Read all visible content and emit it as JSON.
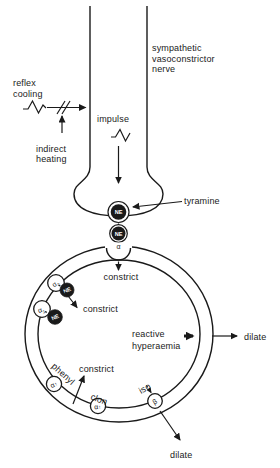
{
  "palette": {
    "ink": "#1a1a1a",
    "paper": "#ffffff",
    "vesicle_fill": "#1a1a1a",
    "vesicle_text": "#ffffff"
  },
  "nerve": {
    "label_line1": "sympathetic",
    "label_line2": "vasoconstrictor",
    "label_line3": "nerve"
  },
  "stimuli": {
    "reflex_line1": "reflex",
    "reflex_line2": "cooling",
    "indirect_line1": "indirect",
    "indirect_line2": "heating",
    "impulse": "impulse",
    "waveform_icon": "action-potential-wave",
    "block_icon": "double-slash-block"
  },
  "junction": {
    "vesicle1": "NE",
    "vesicle2": "NE",
    "tyramine": "tyramine"
  },
  "vessel": {
    "receptor_top": "α",
    "constrict_top": "constrict",
    "constrict_upper_left": "constrict",
    "constrict_lower": "constrict",
    "reactive_line1": "reactive",
    "reactive_line2": "hyperaemia",
    "dilate_right": "dilate",
    "dilate_bottom": "dilate",
    "phenyl": "phenyl",
    "clon": "clon",
    "iso": "iso",
    "ne_granule_upper": "NE",
    "ne_granule_lower": "NE",
    "receptors": {
      "alpha2_upper": {
        "base": "α",
        "sub": "2"
      },
      "alpha1_upper": {
        "base": "α",
        "sub": "1"
      },
      "alpha_phenyl": {
        "base": "α",
        "mark": "↑"
      },
      "alpha_clon": {
        "base": "α",
        "mark": "↑"
      },
      "beta_iso": {
        "base": "β"
      }
    }
  }
}
